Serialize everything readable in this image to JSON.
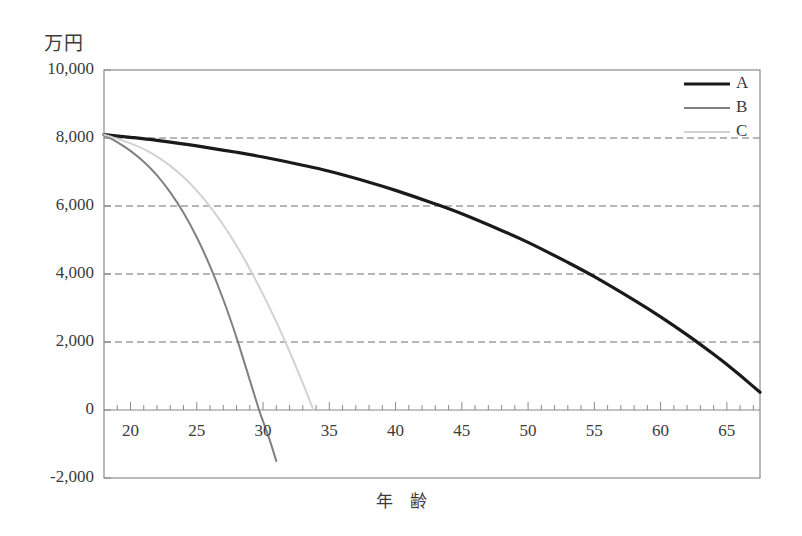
{
  "chart_data": {
    "type": "line",
    "title": "",
    "subtitle": "",
    "ylabel": "万円",
    "xlabel": "年　齢",
    "xlim": [
      18,
      67.5
    ],
    "ylim": [
      -2000,
      10000
    ],
    "grid": true,
    "grid_axis": "y",
    "legend_position": "top-right",
    "x_ticks": [
      20,
      25,
      30,
      35,
      40,
      45,
      50,
      55,
      60,
      65
    ],
    "x_tick_labels": [
      "20",
      "25",
      "30",
      "35",
      "40",
      "45",
      "50",
      "55",
      "60",
      "65"
    ],
    "x_minor_tick_step": 1,
    "y_ticks": [
      -2000,
      0,
      2000,
      4000,
      6000,
      8000,
      10000
    ],
    "y_tick_labels": [
      "-2,000",
      "0",
      "2,000",
      "4,000",
      "6,000",
      "8,000",
      "10,000"
    ],
    "series": [
      {
        "name": "A",
        "color": "#1a1a1a",
        "width": 3.2,
        "x": [
          18,
          20,
          22,
          25,
          28,
          30,
          33,
          35,
          38,
          40,
          43,
          45,
          48,
          50,
          53,
          55,
          58,
          60,
          62,
          64,
          65,
          66,
          67.5
        ],
        "values": [
          8100,
          8020,
          7930,
          7770,
          7580,
          7440,
          7200,
          7020,
          6700,
          6460,
          6060,
          5770,
          5280,
          4930,
          4340,
          3920,
          3230,
          2740,
          2210,
          1640,
          1340,
          1020,
          520
        ]
      },
      {
        "name": "B",
        "color": "#808080",
        "width": 2.0,
        "x": [
          18,
          19,
          20,
          21,
          22,
          23,
          24,
          25,
          26,
          27,
          28,
          29,
          29.7,
          30,
          30.5,
          31
        ],
        "values": [
          8100,
          7880,
          7620,
          7300,
          6900,
          6400,
          5800,
          5080,
          4230,
          3250,
          2130,
          880,
          0,
          -330,
          -880,
          -1500
        ]
      },
      {
        "name": "C",
        "color": "#d2d2d2",
        "width": 2.0,
        "x": [
          18,
          19,
          20,
          21,
          22,
          23,
          24,
          25,
          26,
          27,
          28,
          29,
          30,
          31,
          32,
          33,
          33.8
        ],
        "values": [
          8100,
          7980,
          7840,
          7670,
          7450,
          7180,
          6850,
          6450,
          5980,
          5440,
          4830,
          4150,
          3400,
          2590,
          1720,
          790,
          0
        ]
      }
    ],
    "legend": [
      {
        "label": "A",
        "color": "#1a1a1a",
        "width": 3.2
      },
      {
        "label": "B",
        "color": "#808080",
        "width": 2.0
      },
      {
        "label": "C",
        "color": "#d2d2d2",
        "width": 2.0
      }
    ],
    "colors": {
      "frame": "#8a8a8a",
      "grid": "#6e6e6e",
      "text": "#3b3b3b",
      "background": "#ffffff"
    }
  }
}
